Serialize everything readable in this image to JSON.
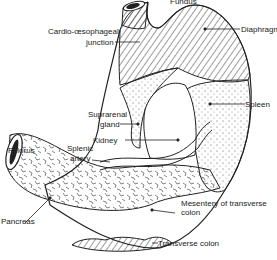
{
  "diagram": {
    "labels": {
      "fundus": "Fundus",
      "cardio_1": "Cardio-œsophageal",
      "cardio_2": "junction",
      "diaphragm": "Diaphragm",
      "suprarenal_1": "Suprarenal",
      "suprarenal_2": "gland",
      "spleen": "Spleen",
      "kidney": "Kidney",
      "splenic_1": "Splenic",
      "splenic_2": "artery",
      "pylorus": "Pylorus",
      "pancreas": "Pancreas",
      "mesentery_1": "Mesentery of transverse",
      "mesentery_2": "colon",
      "transverse_colon": "Transverse colon"
    },
    "colors": {
      "ink": "#222222",
      "background": "#ffffff"
    }
  }
}
